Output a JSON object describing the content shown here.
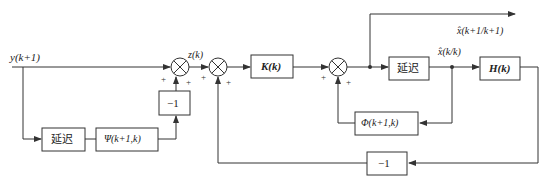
{
  "diagram": {
    "type": "block-diagram",
    "input_label": "y(k+1)",
    "z_label": "z(k)",
    "output_top_label": "x̂(k+1/k+1)",
    "xhat_label": "x̂(k/k)",
    "blocks": {
      "delay_left": "延迟",
      "psi": "Ψ(k+1,k)",
      "neg_one_left": "−1",
      "gain_K": "K(k)",
      "delay_right": "延迟",
      "H": "H(k)",
      "phi": "Φ(k+1,k)",
      "neg_one_bottom": "−1"
    },
    "summer_signs": {
      "s1_left": "+",
      "s1_bottom": "+",
      "s2_left": "+",
      "s2_bottom": "+",
      "s3_left": "+",
      "s3_bottom": "+"
    },
    "colors": {
      "line": "#333333",
      "box_border": "#333333",
      "background": "#ffffff"
    }
  }
}
